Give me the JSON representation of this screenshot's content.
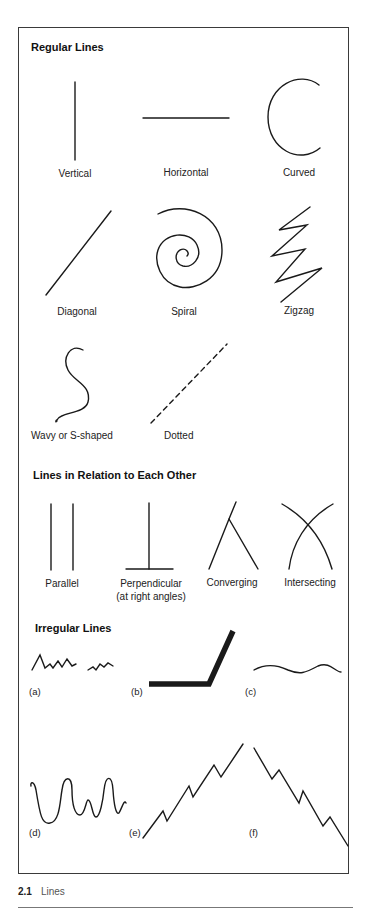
{
  "sections": {
    "regular": {
      "title": "Regular Lines",
      "items": [
        {
          "label": "Vertical"
        },
        {
          "label": "Horizontal"
        },
        {
          "label": "Curved"
        },
        {
          "label": "Diagonal"
        },
        {
          "label": "Spiral"
        },
        {
          "label": "Zigzag"
        },
        {
          "label": "Wavy or S-shaped"
        },
        {
          "label": "Dotted"
        }
      ]
    },
    "relation": {
      "title": "Lines in Relation to Each Other",
      "items": [
        {
          "label": "Parallel"
        },
        {
          "label": "Perpendicular",
          "sublabel": "(at right angles)"
        },
        {
          "label": "Converging"
        },
        {
          "label": "Intersecting"
        }
      ]
    },
    "irregular": {
      "title": "Irregular Lines",
      "items": [
        {
          "tag": "(a)"
        },
        {
          "tag": "(b)"
        },
        {
          "tag": "(c)"
        },
        {
          "tag": "(d)"
        },
        {
          "tag": "(e)"
        },
        {
          "tag": "(f)"
        }
      ]
    }
  },
  "caption": {
    "number": "2.1",
    "text": "Lines"
  },
  "colors": {
    "stroke": "#1a1a1a",
    "border": "#3a3a3a",
    "caption": "#555555"
  }
}
